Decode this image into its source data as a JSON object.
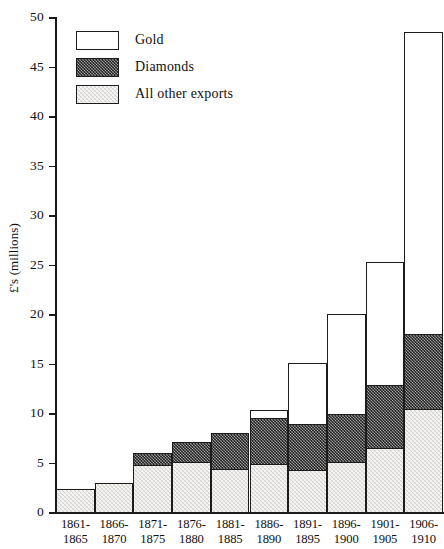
{
  "chart_data": {
    "type": "bar",
    "stacked": true,
    "title": "",
    "subtitle": "",
    "xlabel": "",
    "ylabel": "£'s (millions)",
    "ylim": [
      0,
      50
    ],
    "ytick_step": 5,
    "yticks": [
      "0",
      "5",
      "10",
      "15",
      "20",
      "25",
      "30",
      "35",
      "40",
      "45",
      "50"
    ],
    "grid": false,
    "legend_position": "top-left",
    "categories": [
      "1861-1865",
      "1866-1870",
      "1871-1875",
      "1876-1880",
      "1881-1885",
      "1886-1890",
      "1891-1895",
      "1896-1900",
      "1901-1905",
      "1906-1910"
    ],
    "category_lines": [
      [
        "1861-",
        "1865"
      ],
      [
        "1866-",
        "1870"
      ],
      [
        "1871-",
        "1875"
      ],
      [
        "1876-",
        "1880"
      ],
      [
        "1881-",
        "1885"
      ],
      [
        "1886-",
        "1890"
      ],
      [
        "1891-",
        "1895"
      ],
      [
        "1896-",
        "1900"
      ],
      [
        "1901-",
        "1905"
      ],
      [
        "1906-",
        "1910"
      ]
    ],
    "series": [
      {
        "name": "All other exports",
        "key": "other",
        "swatch": "light-stipple",
        "color": "#d9d7d2",
        "values": [
          2.3,
          2.9,
          4.7,
          5.1,
          4.3,
          4.9,
          4.2,
          5.1,
          6.5,
          10.4
        ]
      },
      {
        "name": "Diamonds",
        "key": "diamonds",
        "swatch": "dark-stipple",
        "color": "#6f6f6f",
        "values": [
          0.0,
          0.0,
          1.2,
          1.9,
          3.7,
          4.6,
          4.7,
          4.8,
          6.3,
          7.6
        ]
      },
      {
        "name": "Gold",
        "key": "gold",
        "swatch": "white",
        "color": "#ffffff",
        "values": [
          0.0,
          0.0,
          0.0,
          0.0,
          0.0,
          0.8,
          6.1,
          10.1,
          12.4,
          30.5
        ]
      }
    ],
    "totals": [
      2.3,
      2.9,
      5.9,
      7.0,
      8.0,
      10.3,
      15.0,
      20.0,
      25.2,
      48.5
    ]
  },
  "legend": {
    "items": [
      {
        "label": "Gold",
        "swatch": "white"
      },
      {
        "label": "Diamonds",
        "swatch": "dark-stipple"
      },
      {
        "label": "All other exports",
        "swatch": "light-stipple"
      }
    ]
  },
  "axes": {
    "y_title": "£'s (millions)"
  }
}
